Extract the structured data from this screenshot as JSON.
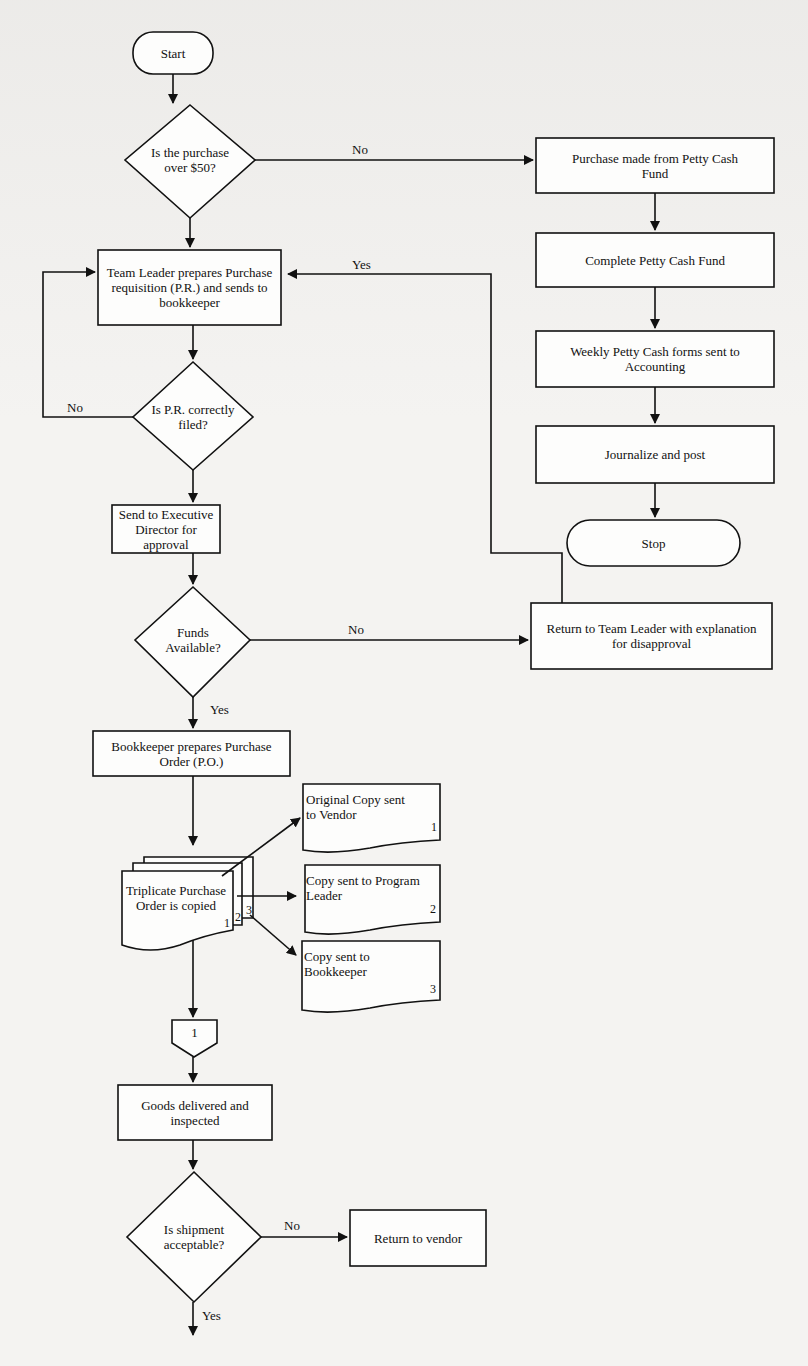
{
  "nodes": {
    "start": "Start",
    "q_over50": "Is the purchase over $50?",
    "petty_purchase": "Purchase made from Petty Cash Fund",
    "complete_petty": "Complete Petty Cash Fund",
    "weekly_forms": "Weekly Petty Cash forms sent to Accounting",
    "journalize": "Journalize and post",
    "stop": "Stop",
    "team_leader_pr": "Team Leader prepares Purchase requisition (P.R.) and sends to bookkeeper",
    "q_pr_filed": "Is P.R. correctly filed?",
    "send_exec": "Send to Executive Director for approval",
    "q_funds": "Funds Available?",
    "return_team_leader": "Return to Team Leader with explanation for disapproval",
    "bookkeeper_po": "Bookkeeper prepares Purchase Order (P.O.)",
    "triplicate_po": "Triplicate Purchase Order is copied",
    "copy_vendor": "Original Copy sent to Vendor",
    "copy_program_leader": "Copy sent to Program Leader",
    "copy_bookkeeper": "Copy sent to Bookkeeper",
    "connector": "1",
    "goods_delivered": "Goods delivered and inspected",
    "q_shipment": "Is shipment acceptable?",
    "return_vendor": "Return to vendor"
  },
  "edge_labels": {
    "over50_no": "No",
    "return_yes": "Yes",
    "pr_no": "No",
    "funds_no": "No",
    "funds_yes": "Yes",
    "shipment_no": "No",
    "shipment_yes": "Yes"
  },
  "copy_numbers": {
    "one": "1",
    "two": "2",
    "three": "3",
    "vendor": "1",
    "program_leader": "2",
    "bookkeeper": "3"
  }
}
